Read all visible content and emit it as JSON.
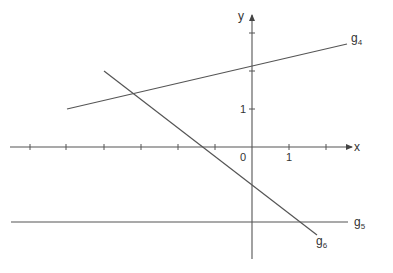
{
  "diagram": {
    "axes": {
      "x_label": "x",
      "y_label": "y",
      "origin_label": "0",
      "x_unit_label": "1",
      "y_unit_label": "1"
    },
    "lines": [
      {
        "name": "g4",
        "base": "g",
        "sub": "4"
      },
      {
        "name": "g5",
        "base": "g",
        "sub": "5"
      },
      {
        "name": "g6",
        "base": "g",
        "sub": "6"
      }
    ],
    "colors": {
      "stroke": "#555555",
      "text": "#333333"
    }
  }
}
